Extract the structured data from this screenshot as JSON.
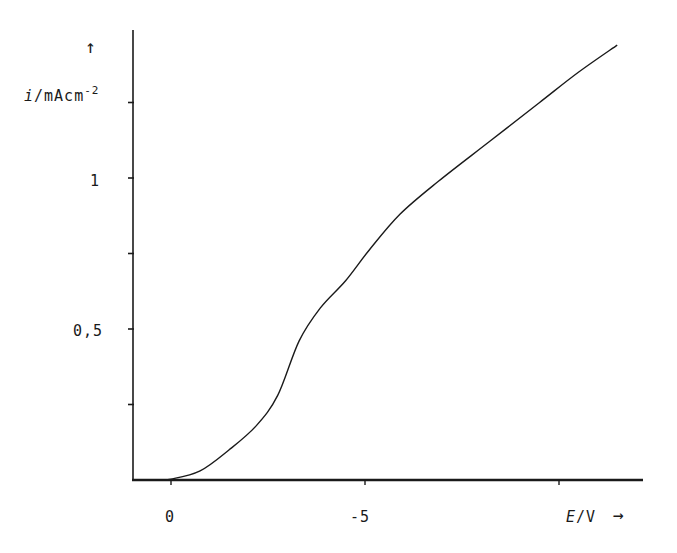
{
  "chart_data": {
    "type": "line",
    "title": "",
    "xlabel": "E/V",
    "ylabel": "i/mAcm^-2",
    "x_axis_arrow": "→",
    "y_axis_arrow": "↑",
    "xlim": [
      0.9,
      -12.1
    ],
    "ylim": [
      0,
      1.6
    ],
    "x_ticks": [
      0,
      -5,
      -10
    ],
    "x_tick_labels": [
      "0",
      "-5",
      ""
    ],
    "y_ticks": [
      0.25,
      0.5,
      0.75,
      1,
      1.25
    ],
    "y_tick_labels": [
      "",
      "0,5",
      "",
      "1",
      ""
    ],
    "grid": false,
    "legend": null,
    "series": [
      {
        "name": "current density",
        "x": [
          0.4,
          0,
          -0.75,
          -1.5,
          -2.2,
          -2.75,
          -3.3,
          -3.85,
          -4.5,
          -5.1,
          -5.9,
          -6.9,
          -8.2,
          -9.5,
          -10.5,
          -11.5
        ],
        "y": [
          0,
          0.003,
          0.03,
          0.1,
          0.18,
          0.28,
          0.46,
          0.57,
          0.66,
          0.76,
          0.88,
          0.99,
          1.12,
          1.25,
          1.35,
          1.44
        ]
      }
    ]
  },
  "labels": {
    "y_arrow": "↑",
    "y_label_italic": "i",
    "y_label_rest": "/mAcm",
    "y_label_sup": "-2",
    "y_tick_1": "1",
    "y_tick_05": "0,5",
    "x_tick_0": "0",
    "x_tick_m5": "-5",
    "x_label_italic": "E",
    "x_label_rest": "/V",
    "x_arrow": "→"
  }
}
